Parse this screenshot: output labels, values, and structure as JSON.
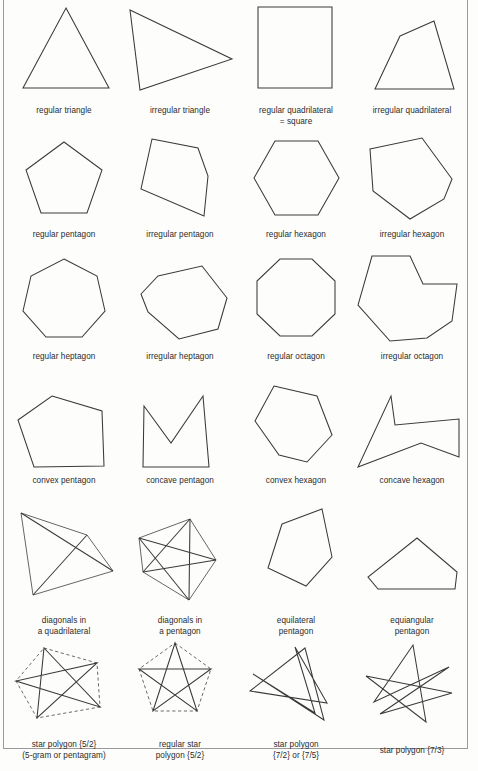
{
  "figure": {
    "title_sliver": "",
    "background_color": "#fdfdfc",
    "stroke_color": "#3a3a3a",
    "frame_color": "#9a9a9a",
    "columns": 4,
    "rows": 6
  },
  "cells": [
    {
      "id": "regular-triangle",
      "caption_line1": "regular triangle",
      "caption_line2": ""
    },
    {
      "id": "irregular-triangle",
      "caption_line1": "irregular triangle",
      "caption_line2": ""
    },
    {
      "id": "regular-quadrilateral",
      "caption_line1": "regular quadrilateral",
      "caption_line2": "= square"
    },
    {
      "id": "irregular-quadrilateral",
      "caption_line1": "irregular quadrilateral",
      "caption_line2": ""
    },
    {
      "id": "regular-pentagon",
      "caption_line1": "regular pentagon",
      "caption_line2": ""
    },
    {
      "id": "irregular-pentagon",
      "caption_line1": "irregular pentagon",
      "caption_line2": ""
    },
    {
      "id": "regular-hexagon",
      "caption_line1": "regular hexagon",
      "caption_line2": ""
    },
    {
      "id": "irregular-hexagon",
      "caption_line1": "irregular hexagon",
      "caption_line2": ""
    },
    {
      "id": "regular-heptagon",
      "caption_line1": "regular heptagon",
      "caption_line2": ""
    },
    {
      "id": "irregular-heptagon",
      "caption_line1": "irregular heptagon",
      "caption_line2": ""
    },
    {
      "id": "regular-octagon",
      "caption_line1": "regular octagon",
      "caption_line2": ""
    },
    {
      "id": "irregular-octagon",
      "caption_line1": "irregular octagon",
      "caption_line2": ""
    },
    {
      "id": "convex-pentagon",
      "caption_line1": "convex pentagon",
      "caption_line2": ""
    },
    {
      "id": "concave-pentagon",
      "caption_line1": "concave pentagon",
      "caption_line2": ""
    },
    {
      "id": "convex-hexagon",
      "caption_line1": "convex hexagon",
      "caption_line2": ""
    },
    {
      "id": "concave-hexagon",
      "caption_line1": "concave hexagon",
      "caption_line2": ""
    },
    {
      "id": "diagonals-quadrilateral",
      "caption_line1": "diagonals in",
      "caption_line2": "a quadrilateral"
    },
    {
      "id": "diagonals-pentagon",
      "caption_line1": "diagonals in",
      "caption_line2": "a pentagon"
    },
    {
      "id": "equilateral-pentagon",
      "caption_line1": "equilateral",
      "caption_line2": "pentagon"
    },
    {
      "id": "equiangular-pentagon",
      "caption_line1": "equiangular",
      "caption_line2": "pentagon"
    },
    {
      "id": "star-polygon-5-2",
      "caption_line1": "star polygon {5/2}",
      "caption_line2": "(5-gram or pentagram)"
    },
    {
      "id": "regular-star-polygon-5-2",
      "caption_line1": "regular star",
      "caption_line2": "polygon {5/2}"
    },
    {
      "id": "star-polygon-7-2",
      "caption_line1": "star polygon",
      "caption_line2": "{7/2} or {7/5}"
    },
    {
      "id": "star-polygon-7-3",
      "caption_line1": "star polygon {7/3}",
      "caption_line2": ""
    }
  ]
}
